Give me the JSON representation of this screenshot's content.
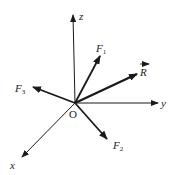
{
  "diagram": {
    "type": "3d-force-vector-diagram",
    "origin": {
      "label": "O",
      "x": 75,
      "y": 103
    },
    "axes": [
      {
        "name": "x",
        "label": "x",
        "tip": [
          22,
          157
        ]
      },
      {
        "name": "y",
        "label": "y",
        "tip": [
          158,
          103
        ]
      },
      {
        "name": "z",
        "label": "z",
        "tip": [
          73,
          14
        ]
      }
    ],
    "forces": [
      {
        "name": "F1",
        "label": "F",
        "subscript": "1",
        "tip": [
          100,
          56
        ],
        "style": "bold"
      },
      {
        "name": "F2",
        "label": "F",
        "subscript": "2",
        "tip": [
          107,
          139
        ],
        "style": "bold"
      },
      {
        "name": "F3",
        "label": "F",
        "subscript": "3",
        "tip": [
          33,
          87
        ],
        "style": "bold"
      },
      {
        "name": "R",
        "label": "R",
        "subscript": "",
        "tip": [
          137,
          74
        ],
        "style": "bold",
        "vector_arrow_overline": true
      }
    ],
    "colors": {
      "line": "#1a1a1a",
      "background": "#ffffff"
    }
  }
}
